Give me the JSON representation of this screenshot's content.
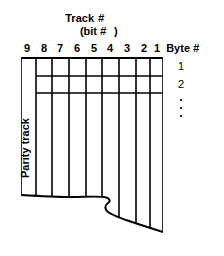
{
  "figure": {
    "title_line1": "Track",
    "title_line1_symbol": "#",
    "title_line2_open": "(bit",
    "title_line2_symbol": "#",
    "title_line2_close": ")",
    "track_numbers": [
      "9",
      "8",
      "7",
      "6",
      "5",
      "4",
      "3",
      "2",
      "1"
    ],
    "parity_track_label": "Parity track",
    "byte_header": "Byte",
    "byte_header_symbol": "#",
    "byte_numbers": [
      "1",
      "2"
    ],
    "byte_continuation": "⋮",
    "colors": {
      "ink": "#000000",
      "paper": "#ffffff"
    }
  }
}
